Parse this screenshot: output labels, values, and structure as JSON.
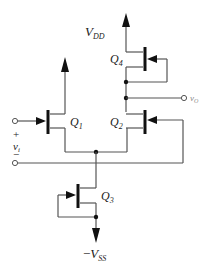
{
  "diagram": {
    "type": "circuit",
    "labels": {
      "vdd": {
        "main": "V",
        "sub": "DD"
      },
      "vss": {
        "prefix": "−",
        "main": "V",
        "sub": "SS"
      },
      "q1": {
        "main": "Q",
        "sub": "1"
      },
      "q2": {
        "main": "Q",
        "sub": "2"
      },
      "q3": {
        "main": "Q",
        "sub": "3"
      },
      "q4": {
        "main": "Q",
        "sub": "4"
      },
      "vo": {
        "main": "v",
        "sub": "O"
      },
      "vi": {
        "main": "v",
        "sub": "i"
      },
      "plus": "+",
      "minus": "−"
    },
    "colors": {
      "wire": "#555555",
      "device": "#111111",
      "text": "#222222",
      "output_label": "#888888"
    }
  }
}
